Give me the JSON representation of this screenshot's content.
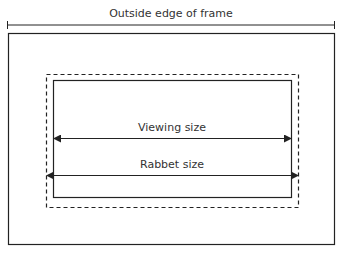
{
  "diagram": {
    "labels": {
      "outside_edge": "Outside edge of frame",
      "viewing_size": "Viewing size",
      "rabbet_size": "Rabbet size"
    },
    "colors": {
      "stroke": "#222222",
      "text": "#333333",
      "background": "#ffffff"
    },
    "elements": [
      {
        "name": "outer-frame-edge",
        "style": "solid"
      },
      {
        "name": "rabbet-outline",
        "style": "dashed"
      },
      {
        "name": "viewing-opening",
        "style": "solid"
      },
      {
        "name": "viewing-size-arrow",
        "style": "double-arrow"
      },
      {
        "name": "rabbet-size-arrow",
        "style": "double-arrow"
      },
      {
        "name": "outside-edge-dimension-line",
        "style": "line-with-end-ticks"
      }
    ]
  }
}
